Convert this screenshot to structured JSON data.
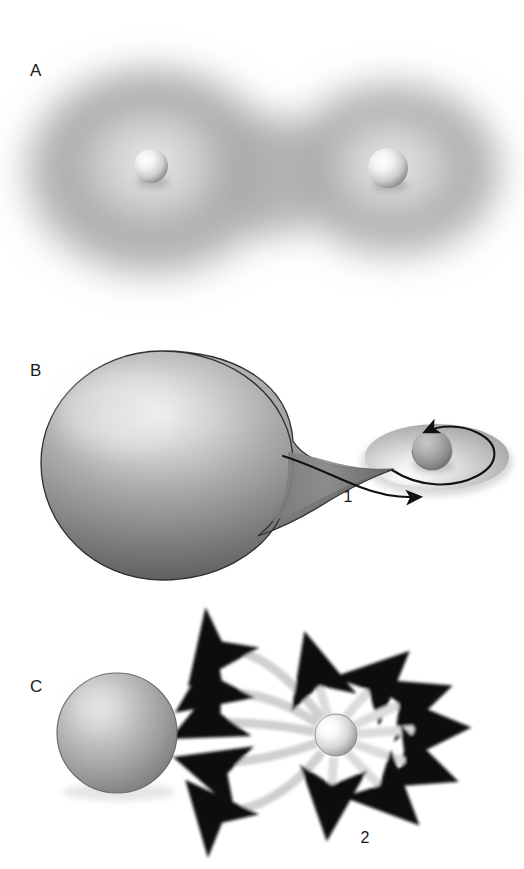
{
  "figure": {
    "background_color": "#ffffff",
    "width": 524,
    "height": 869
  },
  "panels": [
    {
      "id": "panel-a",
      "label": "A",
      "label_x": 30,
      "label_y": 76,
      "description": "Contact binary: two overlapping diffuse gaseous envelopes each containing a small bright stellar core",
      "objects": {
        "left_cloud": {
          "cx": 152,
          "cy": 178,
          "rx": 140,
          "ry": 118
        },
        "right_cloud": {
          "cx": 390,
          "cy": 172,
          "rx": 118,
          "ry": 96
        },
        "left_core": {
          "cx": 151,
          "cy": 166,
          "r": 17
        },
        "right_core": {
          "cx": 388,
          "cy": 168,
          "r": 20
        }
      },
      "colors": {
        "cloud_dark": "#8c8c8c",
        "cloud_mid": "#b0b0b0",
        "cloud_light": "#d8d8d8",
        "core_bright": "#ffffff",
        "core_shade": "#9a9a9a"
      }
    },
    {
      "id": "panel-b",
      "label": "B",
      "label_x": 30,
      "label_y": 376,
      "description": "Roche lobe overflow: a large teardrop-shaped donor star streams material through the inner Lagrange point onto an accretion disk around a compact companion",
      "callout": {
        "text": "1",
        "x": 348,
        "y": 502,
        "meaning": "mass transfer stream"
      },
      "objects": {
        "donor_star": {
          "cx": 170,
          "cy": 468,
          "rx": 122,
          "ry": 116
        },
        "accretion_disk": {
          "cx": 437,
          "cy": 457,
          "rx": 72,
          "ry": 33
        },
        "companion_core": {
          "cx": 432,
          "cy": 450,
          "r": 20
        }
      },
      "colors": {
        "star_highlight": "#e8e8e8",
        "star_mid": "#9e9e9e",
        "star_dark": "#5a5a5a",
        "star_outline": "#333333",
        "disk_light": "#f2f2f2",
        "disk_mid": "#c2c2c2",
        "disk_shade": "#9c9c9c",
        "arrow_stroke": "#111111"
      }
    },
    {
      "id": "panel-c",
      "label": "C",
      "label_x": 30,
      "label_y": 692,
      "description": "Post-transfer: the compact remnant radiates energy outward in all directions, some of which is intercepted by the companion star",
      "callout": {
        "text": "2",
        "x": 365,
        "y": 843,
        "meaning": "radiation / wind outflow"
      },
      "objects": {
        "companion_sphere": {
          "cx": 117,
          "cy": 733,
          "r": 60
        },
        "emitting_core": {
          "cx": 336,
          "cy": 735,
          "r": 21
        }
      },
      "colors": {
        "sphere_highlight": "#dcdcdc",
        "sphere_mid": "#a8a8a8",
        "sphere_dark": "#6e6e6e",
        "sphere_outline": "#555555",
        "core_bright": "#ffffff",
        "core_shade": "#909090",
        "ray_color": "#d5d5d5",
        "ray_color_dark": "#c4c4c4"
      },
      "ray_counts": {
        "toward_companion": 5,
        "outward": 7
      }
    }
  ],
  "legend": {
    "items": [
      {
        "number": "1",
        "panel": "B"
      },
      {
        "number": "2",
        "panel": "C"
      }
    ]
  }
}
